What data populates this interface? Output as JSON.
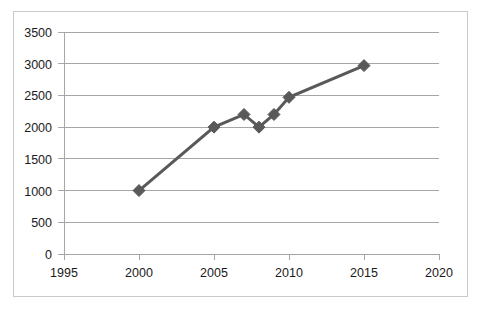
{
  "chart_data": {
    "type": "line",
    "title": "",
    "xlabel": "",
    "ylabel": "",
    "x": [
      2000,
      2005,
      2007,
      2008,
      2009,
      2010,
      2015
    ],
    "values": [
      1000,
      2000,
      2200,
      2000,
      2200,
      2470,
      2970
    ],
    "series": [
      {
        "name": "",
        "x": [
          2000,
          2005,
          2007,
          2008,
          2009,
          2010,
          2015
        ],
        "values": [
          1000,
          2000,
          2200,
          2000,
          2200,
          2470,
          2970
        ]
      }
    ],
    "xlim": [
      1995,
      2020
    ],
    "ylim": [
      0,
      3500
    ],
    "x_ticks": [
      1995,
      2000,
      2005,
      2010,
      2015,
      2020
    ],
    "x_tick_labels": [
      "1995",
      "2000",
      "2005",
      "2010",
      "2015",
      "2020"
    ],
    "y_ticks": [
      0,
      500,
      1000,
      1500,
      2000,
      2500,
      3000,
      3500
    ],
    "y_tick_labels": [
      "0",
      "500",
      "1000",
      "1500",
      "2000",
      "2500",
      "3000",
      "3500"
    ],
    "grid": "horizontal",
    "legend": "none",
    "marker": "diamond",
    "colors": {
      "series_line": "#595959",
      "marker": "#595959",
      "gridline": "#a6a6a6",
      "axis": "#a6a6a6",
      "border": "#c9c9c9",
      "tick_text": "#1a1a1a",
      "background": "#ffffff"
    }
  },
  "axis_labels": {
    "y": {
      "t0": "0",
      "t1": "500",
      "t2": "1000",
      "t3": "1500",
      "t4": "2000",
      "t5": "2500",
      "t6": "3000",
      "t7": "3500"
    },
    "x": {
      "t0": "1995",
      "t1": "2000",
      "t2": "2005",
      "t3": "2010",
      "t4": "2015",
      "t5": "2020"
    }
  }
}
